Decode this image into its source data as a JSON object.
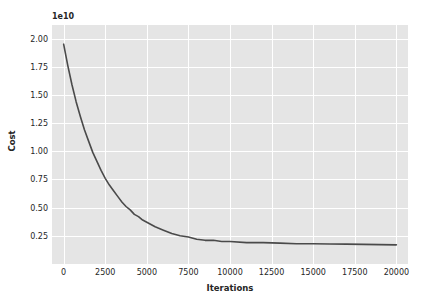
{
  "chart_data": {
    "type": "line",
    "title": "",
    "xlabel": "Iterations",
    "ylabel": "Cost",
    "y_offset_text": "1e10",
    "y_offset_multiplier": 10000000000.0,
    "xlim": [
      -700,
      20700
    ],
    "ylim": [
      0,
      2.12
    ],
    "xticks": [
      0,
      2500,
      5000,
      7500,
      10000,
      12500,
      15000,
      17500,
      20000
    ],
    "xtick_labels": [
      "0",
      "2500",
      "5000",
      "7500",
      "10000",
      "12500",
      "15000",
      "17500",
      "20000"
    ],
    "yticks": [
      0.25,
      0.5,
      0.75,
      1.0,
      1.25,
      1.5,
      1.75,
      2.0
    ],
    "ytick_labels": [
      "0.25",
      "0.50",
      "0.75",
      "1.00",
      "1.25",
      "1.50",
      "1.75",
      "2.00"
    ],
    "grid": true,
    "legend": null,
    "series": [
      {
        "name": "Cost",
        "color": "#4a4a4a",
        "linewidth": 1.6,
        "x": [
          0,
          250,
          500,
          750,
          1000,
          1250,
          1500,
          1750,
          2000,
          2250,
          2500,
          2750,
          3000,
          3250,
          3500,
          3750,
          4000,
          4250,
          4500,
          4750,
          5000,
          5500,
          6000,
          6500,
          7000,
          7500,
          8000,
          8500,
          9000,
          9500,
          10000,
          11000,
          12000,
          13000,
          14000,
          15000,
          16000,
          17000,
          18000,
          19000,
          20000
        ],
        "values": [
          1.95,
          1.76,
          1.59,
          1.44,
          1.31,
          1.19,
          1.09,
          0.99,
          0.91,
          0.83,
          0.76,
          0.7,
          0.65,
          0.6,
          0.55,
          0.51,
          0.48,
          0.44,
          0.42,
          0.39,
          0.37,
          0.33,
          0.3,
          0.27,
          0.25,
          0.24,
          0.22,
          0.21,
          0.21,
          0.2,
          0.2,
          0.19,
          0.19,
          0.185,
          0.18,
          0.18,
          0.178,
          0.176,
          0.174,
          0.172,
          0.17
        ]
      }
    ],
    "style": {
      "figure_background": "#ffffff",
      "axes_background": "#e5e5e5",
      "grid_color": "#ffffff",
      "tick_label_color": "#262626"
    }
  }
}
